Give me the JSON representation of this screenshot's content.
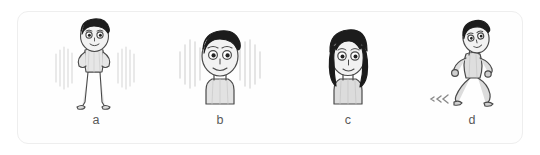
{
  "figure": {
    "background_color": "#ffffff",
    "card_border_color": "#eeeeee",
    "card_fill_color": "#fefefe",
    "label_color": "#595959",
    "ink_color": "#4a4a4a",
    "hair_color": "#1c1c1c",
    "shade_color": "#d8d8d8",
    "motion_color": "#cfcfcf",
    "panels": [
      {
        "id": "a",
        "label": "a",
        "caption_letter": "a",
        "subject": "cartoon-man-standing-full-body",
        "pose": "standing with hands on hips",
        "has_motion_lines": true,
        "motion_lines_position": "both sides of body",
        "hair_style": "short swept dark hair"
      },
      {
        "id": "b",
        "label": "b",
        "caption_letter": "b",
        "subject": "cartoon-man-head-closeup",
        "pose": "head and shoulders bust",
        "has_motion_lines": true,
        "motion_lines_position": "radiating around head",
        "hair_style": "short swept dark hair"
      },
      {
        "id": "c",
        "label": "c",
        "caption_letter": "c",
        "subject": "cartoon-person-head-long-hair",
        "pose": "head and shoulders bust",
        "has_motion_lines": false,
        "motion_lines_position": "",
        "hair_style": "long shaggy dark hair covering sides"
      },
      {
        "id": "d",
        "label": "d",
        "caption_letter": "d",
        "subject": "cartoon-man-running",
        "pose": "running to the right",
        "has_motion_lines": true,
        "motion_lines_position": "speed marks behind trailing foot",
        "hair_style": "short swept dark hair"
      }
    ]
  }
}
